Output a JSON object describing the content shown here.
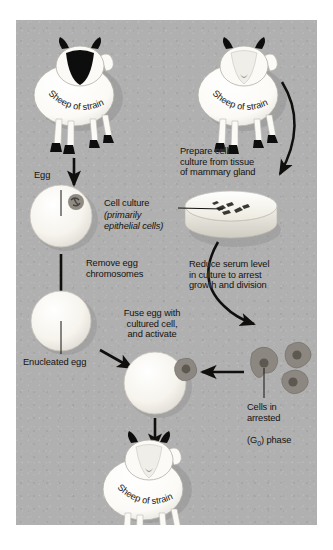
{
  "figure": {
    "panel_bg_color": "#b0b0b0",
    "outer_bg_color": "#ffffff",
    "ink_color": "#15120f"
  },
  "organisms": {
    "donor_sheep_a": {
      "label": "Sheep of strain A",
      "face_color": "#0d0d0d",
      "body_color": "#fdfdfb",
      "role": "egg donor"
    },
    "donor_sheep_b": {
      "label": "Sheep of strain B",
      "face_color": "#e9e9e4",
      "body_color": "#fdfdfb",
      "role": "nucleus donor"
    },
    "clone_sheep_b": {
      "label": "Sheep of strain B",
      "face_color": "#e9e9e4",
      "body_color": "#fdfdfb",
      "role": "cloned offspring"
    }
  },
  "labels": {
    "egg": "Egg",
    "remove_egg_chromosomes": "Remove egg\nchromosomes",
    "enucleated_egg": "Enucleated egg",
    "fuse_egg": "Fuse egg with\ncultured cell,\nand activate",
    "prepare_cell_culture": "Prepare cell\nculture from tissue\nof mammary gland",
    "cell_culture": "Cell culture",
    "cell_culture_detail_1": "(primarily",
    "cell_culture_detail_2": "epithelial cells)",
    "reduce_serum": "Reduce serum level\nin culture to arrest\ngrowth and division",
    "cells_arrested_line1": "Cells in",
    "cells_arrested_line2": "arrested",
    "cells_arrested_line3_pre": "(G",
    "cells_arrested_line3_sub": "0",
    "cells_arrested_line3_post": ") phase"
  },
  "structures": {
    "egg_cell": {
      "name": "egg-cell",
      "fill": "#f7f5ef",
      "nucleus_color": "#7a756d"
    },
    "enucleated_egg": {
      "name": "enucleated-egg-cell",
      "fill": "#f7f5ef"
    },
    "fused_cell": {
      "name": "fused-egg-cell",
      "fill": "#f7f5ef"
    },
    "petri_dish": {
      "name": "petri-dish",
      "fill": "#f5f3ec",
      "rim": "#cfcdc6"
    },
    "cultured_cells": {
      "name": "cultured-epithelial-cells",
      "fill": "#3b3833"
    },
    "arrested_cells": {
      "name": "arrested-g0-cells",
      "fill": "#8c8780",
      "nucleus_color": "#5d5951"
    }
  },
  "flow_steps": [
    {
      "from": "Sheep of strain A",
      "to": "Egg",
      "type": "straight-arrow-down"
    },
    {
      "from": "Egg",
      "to": "Enucleated egg",
      "type": "straight-arrow-down",
      "annotation": "Remove egg chromosomes"
    },
    {
      "from": "Enucleated egg",
      "to": "Fused cell",
      "type": "diagonal-arrow-right",
      "annotation": "Fuse egg with cultured cell, and activate"
    },
    {
      "from": "Sheep of strain B",
      "to": "Cell culture",
      "type": "curved-arrow",
      "annotation": "Prepare cell culture from tissue of mammary gland"
    },
    {
      "from": "Cell culture",
      "to": "Arrested cells",
      "type": "curved-arrow",
      "annotation": "Reduce serum level in culture to arrest growth and division"
    },
    {
      "from": "Arrested cells",
      "to": "Fused cell",
      "type": "straight-arrow-left"
    },
    {
      "from": "Fused cell",
      "to": "Sheep of strain B (clone)",
      "type": "straight-arrow-down"
    }
  ]
}
